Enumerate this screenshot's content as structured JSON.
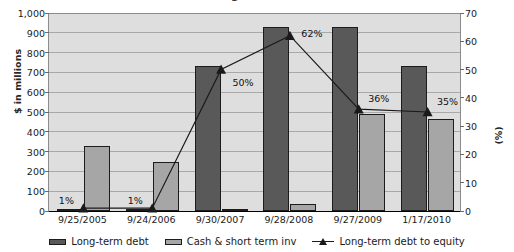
{
  "title_fragment": "Long-term debt",
  "chart_data": {
    "type": "bar",
    "title": "Long-term debt",
    "xlabel": "",
    "ylabel": "$ in millions",
    "y2label": "(%)",
    "categories": [
      "9/25/2005",
      "9/24/2006",
      "9/30/2007",
      "9/28/2008",
      "9/27/2009",
      "1/17/2010"
    ],
    "ylim": [
      0,
      1000
    ],
    "y2lim": [
      0,
      70
    ],
    "yticks": [
      "0",
      "100",
      "200",
      "300",
      "400",
      "500",
      "600",
      "700",
      "800",
      "900",
      "1,000"
    ],
    "y2ticks": [
      "0",
      "10",
      "20",
      "30",
      "40",
      "50",
      "60",
      "70"
    ],
    "grid": true,
    "legend_position": "bottom",
    "series": [
      {
        "name": "Long-term debt",
        "type": "bar",
        "axis": "left",
        "color": "#595959",
        "values": [
          10,
          10,
          730,
          930,
          930,
          730
        ]
      },
      {
        "name": "Cash & short term inv",
        "type": "bar",
        "axis": "left",
        "color": "#a6a6a6",
        "values": [
          330,
          250,
          5,
          35,
          490,
          465
        ]
      },
      {
        "name": "Long-term debt to equity",
        "type": "line",
        "axis": "right",
        "color": "#1a1a1a",
        "marker": "triangle",
        "values": [
          1,
          1,
          50,
          62,
          36,
          35
        ],
        "data_labels": [
          "1%",
          "1%",
          "50%",
          "62%",
          "36%",
          "35%"
        ]
      }
    ]
  },
  "legend": [
    {
      "label": "Long-term debt",
      "marker": "bar-dark"
    },
    {
      "label": "Cash & short term inv",
      "marker": "bar-light"
    },
    {
      "label": "Long-term debt to equity",
      "marker": "line-triangle"
    }
  ]
}
